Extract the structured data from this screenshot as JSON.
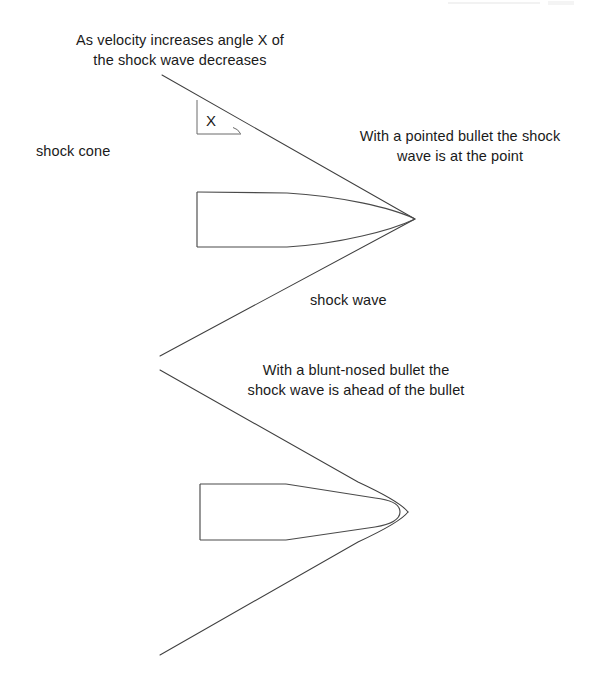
{
  "page": {
    "width": 599,
    "height": 686,
    "background": "#ffffff",
    "ink_color": "#3a3a3a",
    "text_color": "#1a1a1a"
  },
  "captions": {
    "velocity_note": "As velocity increases angle X of\nthe shock wave decreases",
    "pointed_bullet": "With a pointed bullet the shock\nwave is at the point",
    "blunt_bullet": "With a blunt-nosed bullet the\nshock wave is ahead of the bullet"
  },
  "labels": {
    "shock_cone": "shock cone",
    "shock_wave": "shock wave",
    "angle_x": "X"
  },
  "figures": {
    "pointed_bullet": {
      "name": "pointed-bullet",
      "tip_x": 415,
      "tip_y": 219,
      "body_left": 197,
      "body_top": 192,
      "body_bottom": 247
    },
    "blunt_bullet": {
      "name": "blunt-nosed-bullet",
      "nose_x": 400,
      "nose_y": 512,
      "body_left": 200,
      "body_top": 484,
      "body_bottom": 540
    },
    "upper_shock_cone": {
      "apex_x": 415,
      "apex_y": 219,
      "upper_end_x": 162,
      "upper_end_y": 75,
      "lower_end_x": 160,
      "lower_end_y": 355
    },
    "lower_shock_cone": {
      "apex_x": 418,
      "apex_y": 512,
      "upper_end_x": 160,
      "upper_end_y": 370,
      "lower_end_x": 160,
      "lower_end_y": 655
    },
    "angle_marker": {
      "vertex_x": 240,
      "vertex_y": 134,
      "vertical_x": 197,
      "vertical_top_y": 100,
      "vertical_bottom_y": 134
    }
  }
}
